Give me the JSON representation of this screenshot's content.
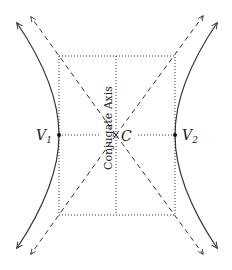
{
  "diagram": {
    "labels": {
      "vertex_left": "V",
      "vertex_left_sub": "1",
      "vertex_right": "V",
      "vertex_right_sub": "2",
      "center": "C",
      "conjugate_axis": "Conjugate Axis"
    },
    "colors": {
      "stroke": "#333333",
      "background": "#ffffff"
    },
    "elements": [
      "hyperbola-left-branch",
      "hyperbola-right-branch",
      "asymptote-1",
      "asymptote-2",
      "fundamental-rectangle",
      "conjugate-axis-line",
      "transverse-axis-line",
      "vertex-v1",
      "vertex-v2",
      "center-c"
    ]
  }
}
